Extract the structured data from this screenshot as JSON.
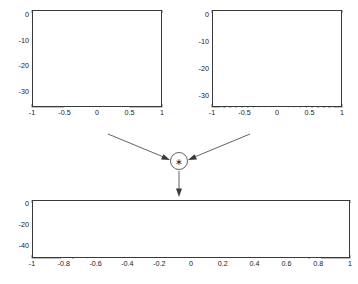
{
  "figure": {
    "title": "",
    "operator_symbol": "∗",
    "operator_name": "convolution-operator"
  },
  "chart_data": [
    {
      "id": "rect-window",
      "type": "line",
      "title": "",
      "xlabel": "",
      "ylabel": "",
      "xlim": [
        -1,
        1
      ],
      "ylim": [
        -36,
        2
      ],
      "grid": false,
      "legend": null,
      "xticks": [
        -1,
        -0.5,
        0,
        0.5,
        1
      ],
      "xticklabels": [
        "-1",
        "-0.5",
        "0",
        "0.5",
        "1"
      ],
      "yticks": [
        0,
        -10,
        -20,
        -30
      ],
      "yticklabels": [
        "0",
        "-10",
        "-20",
        "-30"
      ],
      "description": "Ideal brick-wall lowpass magnitude in dB: 0 dB between -0.5 and 0.5, dropping to floor outside.",
      "series": [
        {
          "name": "ideal-rect",
          "x": [
            -1,
            -0.5,
            -0.5,
            0.5,
            0.5,
            1
          ],
          "y": [
            -36,
            -36,
            0,
            0,
            -36,
            -36
          ]
        }
      ]
    },
    {
      "id": "dirichlet-kernel",
      "type": "line",
      "title": "",
      "xlabel": "",
      "ylabel": "",
      "xlim": [
        -1,
        1
      ],
      "ylim": [
        -34,
        2
      ],
      "grid": false,
      "legend": null,
      "xticks": [
        -1,
        -0.5,
        0,
        0.5,
        1
      ],
      "xticklabels": [
        "-1",
        "-0.5",
        "0",
        "0.5",
        "1"
      ],
      "yticks": [
        0,
        -10,
        -20,
        -30
      ],
      "yticklabels": [
        "0",
        "-10",
        "-20",
        "-30"
      ],
      "description": "Magnitude in dB of a rectangular-window Dirichlet kernel: 0 dB main lobe at x=0, first sidelobe about -13 dB, sidelobes decaying to about -30 dB at the band edges, roughly 22 nulls across the range.",
      "sinc_parameters": {
        "main_lobe_peak_db": 0,
        "main_lobe_half_width": 0.09,
        "first_sidelobe_db": -13.3,
        "null_spacing": 0.09,
        "floor_db": -34
      }
    },
    {
      "id": "windowed-filter-response",
      "type": "line",
      "title": "",
      "xlabel": "",
      "ylabel": "",
      "xlim": [
        -1,
        1
      ],
      "ylim": [
        -52,
        4
      ],
      "grid": false,
      "legend": null,
      "xticks": [
        -1,
        -0.8,
        -0.6,
        -0.4,
        -0.2,
        0,
        0.2,
        0.4,
        0.6,
        0.8,
        1
      ],
      "xticklabels": [
        "-1",
        "-0.8",
        "-0.6",
        "-0.4",
        "-0.2",
        "0",
        "0.2",
        "0.4",
        "0.6",
        "0.8",
        "1"
      ],
      "yticks": [
        0,
        -20,
        -40
      ],
      "yticklabels": [
        "0",
        "-20",
        "-40"
      ],
      "description": "Result of convolving the ideal rect response with the Dirichlet kernel: a realizable lowpass filter with slightly rippled 0 dB passband between about -0.47 and 0.47, steep transition bands near +/-0.55, and stopband sidelobes reaching about -25 dB at the first lobe and decaying toward -50 dB.",
      "response_parameters": {
        "passband_edge": 0.47,
        "transition_edge": 0.55,
        "passband_ripple_db": 1.0,
        "first_stopband_lobe_db": -25,
        "stopband_floor_db": -50
      }
    }
  ],
  "annotations": {
    "arrow_left_name": "arrow-from-rect-to-operator",
    "arrow_right_name": "arrow-from-kernel-to-operator",
    "arrow_down_name": "arrow-from-operator-to-result"
  }
}
